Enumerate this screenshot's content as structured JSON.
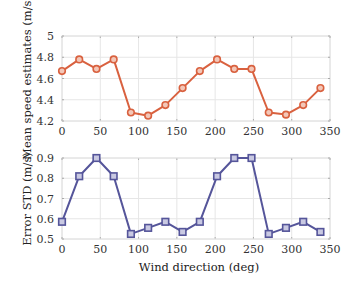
{
  "chart_data": [
    {
      "type": "line",
      "title": "",
      "xlabel": "",
      "ylabel": "Mean speed estimates (m/s)",
      "x": [
        0,
        22.5,
        45,
        67.5,
        90,
        112.5,
        135,
        157.5,
        180,
        202.5,
        225,
        247.5,
        270,
        292.5,
        315,
        337.5
      ],
      "series": [
        {
          "name": "Mean speed estimates",
          "values": [
            4.67,
            4.78,
            4.69,
            4.78,
            4.28,
            4.25,
            4.35,
            4.51,
            4.67,
            4.78,
            4.69,
            4.69,
            4.28,
            4.26,
            4.35,
            4.51
          ],
          "color": "#d9613f",
          "marker": "circle"
        }
      ],
      "xlim": [
        0,
        350
      ],
      "ylim": [
        4.2,
        5
      ],
      "xticks": [
        "0",
        "50",
        "100",
        "150",
        "200",
        "250",
        "300",
        "350"
      ],
      "yticks": [
        "4.2",
        "4.4",
        "4.6",
        "4.8",
        "5"
      ],
      "grid": true,
      "legend": null
    },
    {
      "type": "line",
      "title": "",
      "xlabel": "Wind direction (deg)",
      "ylabel": "Error STD (m/s)",
      "x": [
        0,
        22.5,
        45,
        67.5,
        90,
        112.5,
        135,
        157.5,
        180,
        202.5,
        225,
        247.5,
        270,
        292.5,
        315,
        337.5
      ],
      "series": [
        {
          "name": "Error STD",
          "values": [
            0.585,
            0.81,
            0.9,
            0.81,
            0.525,
            0.555,
            0.585,
            0.535,
            0.585,
            0.81,
            0.9,
            0.9,
            0.525,
            0.555,
            0.585,
            0.535
          ],
          "color": "#55559a",
          "marker": "square"
        }
      ],
      "xlim": [
        0,
        350
      ],
      "ylim": [
        0.5,
        0.9
      ],
      "xticks": [
        "0",
        "50",
        "100",
        "150",
        "200",
        "250",
        "300",
        "350"
      ],
      "yticks": [
        "0.5",
        "0.6",
        "0.7",
        "0.8",
        "0.9"
      ],
      "grid": true,
      "legend": null
    }
  ]
}
